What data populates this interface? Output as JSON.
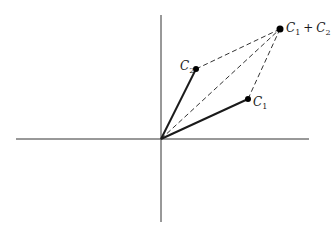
{
  "diagram": {
    "type": "vector-addition-parallelogram",
    "colors": {
      "axes": "#333333",
      "vectors": "#1a1a1a",
      "dashed": "#333333",
      "points": "#000000"
    },
    "axes": {
      "horizontal": {
        "x1": 16,
        "y1": 139,
        "x2": 309,
        "y2": 139
      },
      "vertical": {
        "x1": 161,
        "y1": 15,
        "x2": 161,
        "y2": 222
      }
    },
    "origin": {
      "x": 161,
      "y": 139
    },
    "points": [
      {
        "id": "C1",
        "x": 248,
        "y": 99,
        "label_main": "C",
        "label_sub": "1",
        "label_suffix": ""
      },
      {
        "id": "C2",
        "x": 196,
        "y": 69,
        "label_main": "C",
        "label_sub": "2",
        "label_suffix": ""
      },
      {
        "id": "C1+C2",
        "x": 280,
        "y": 29,
        "label_main": "C",
        "label_sub": "1",
        "label_suffix": " + C",
        "label_sub2": "2"
      }
    ],
    "labels": {
      "c1": {
        "main": "C",
        "sub": "1"
      },
      "c2": {
        "main": "C",
        "sub": "2"
      },
      "sum": {
        "main": "C",
        "sub": "1",
        "plus": "+",
        "main2": "C",
        "sub2": "2"
      }
    },
    "solid_vectors": [
      "origin->C1",
      "origin->C2"
    ],
    "dashed_lines": [
      "C2->C1+C2",
      "C1->C1+C2",
      "origin->C1+C2"
    ]
  }
}
